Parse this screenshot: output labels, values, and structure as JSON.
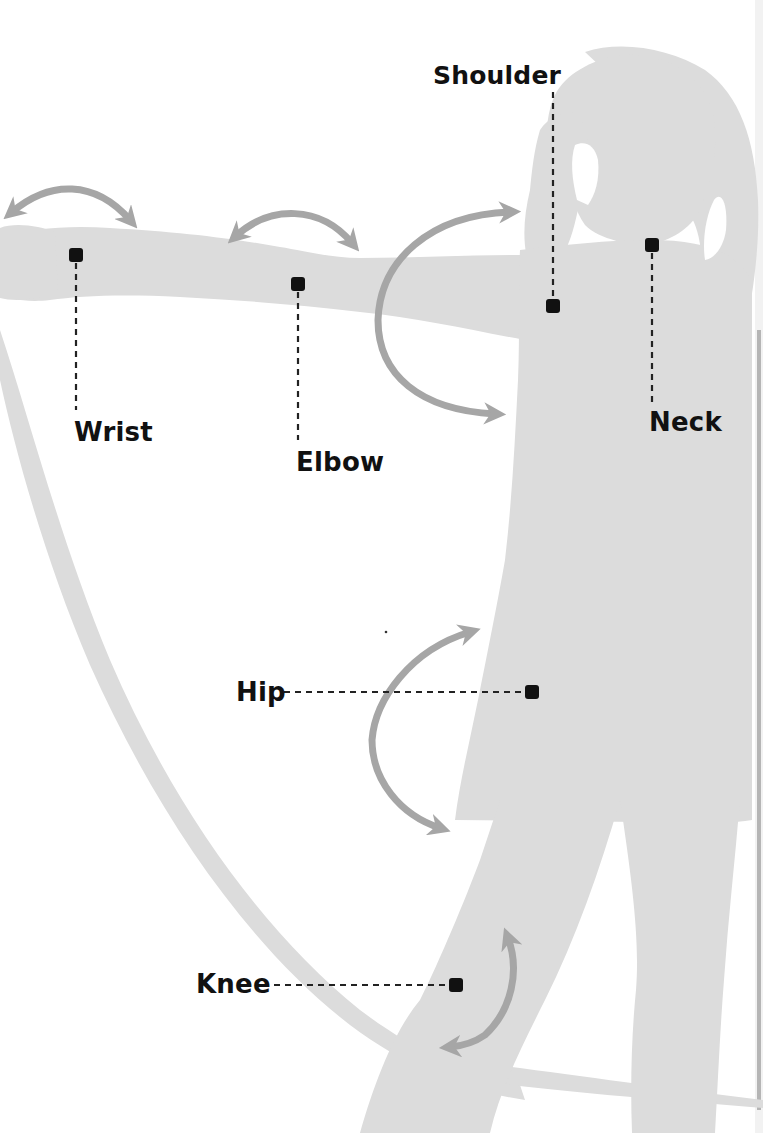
{
  "diagram": {
    "type": "anatomy-joint-diagram",
    "colors": {
      "background": "#ffffff",
      "silhouette": "#dcdcdc",
      "arrow": "#a6a6a6",
      "marker": "#111111",
      "leader_line": "#222222",
      "label_text": "#111111",
      "right_edge_bar": "#b5b5b5"
    },
    "joints": [
      {
        "id": "shoulder",
        "label": "Shoulder",
        "marker": [
          553,
          306
        ],
        "label_pos": [
          433,
          62
        ],
        "leader": {
          "orientation": "vertical",
          "from": [
            553,
            92
          ],
          "to": [
            553,
            298
          ]
        }
      },
      {
        "id": "neck",
        "label": "Neck",
        "marker": [
          652,
          245
        ],
        "label_pos": [
          649,
          408
        ],
        "leader": {
          "orientation": "vertical",
          "from": [
            652,
            253
          ],
          "to": [
            652,
            404
          ]
        }
      },
      {
        "id": "wrist",
        "label": "Wrist",
        "marker": [
          76,
          255
        ],
        "label_pos": [
          74,
          419
        ],
        "leader": {
          "orientation": "vertical",
          "from": [
            76,
            263
          ],
          "to": [
            76,
            410
          ]
        }
      },
      {
        "id": "elbow",
        "label": "Elbow",
        "marker": [
          298,
          284
        ],
        "label_pos": [
          296,
          449
        ],
        "leader": {
          "orientation": "vertical",
          "from": [
            298,
            292
          ],
          "to": [
            298,
            440
          ]
        }
      },
      {
        "id": "hip",
        "label": "Hip",
        "marker": [
          532,
          692
        ],
        "label_pos": [
          236,
          679
        ],
        "leader": {
          "orientation": "horizontal",
          "from": [
            284,
            692
          ],
          "to": [
            524,
            692
          ]
        }
      },
      {
        "id": "knee",
        "label": "Knee",
        "marker": [
          456,
          985
        ],
        "label_pos": [
          196,
          970
        ],
        "leader": {
          "orientation": "horizontal",
          "from": [
            274,
            985
          ],
          "to": [
            448,
            985
          ]
        }
      }
    ],
    "motion_arrows": [
      {
        "id": "wrist-arrow",
        "joint": "wrist",
        "direction": "double-headed"
      },
      {
        "id": "elbow-arrow",
        "joint": "elbow",
        "direction": "double-headed"
      },
      {
        "id": "shoulder-arrow",
        "joint": "shoulder",
        "direction": "double-headed"
      },
      {
        "id": "hip-arrow",
        "joint": "hip",
        "direction": "double-headed"
      },
      {
        "id": "knee-arrow",
        "joint": "knee",
        "direction": "double-headed"
      }
    ]
  }
}
